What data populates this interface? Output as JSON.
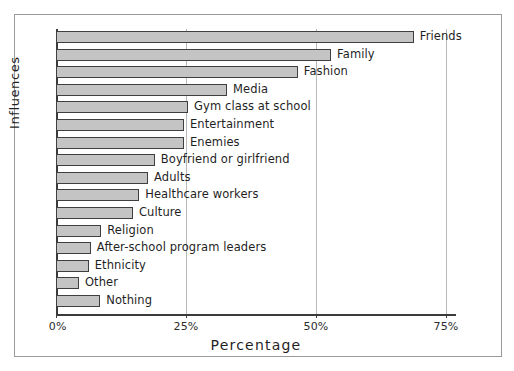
{
  "chart_data": {
    "type": "bar",
    "orientation": "horizontal",
    "title": "",
    "xlabel": "Percentage",
    "ylabel": "Influences",
    "xlim": [
      0,
      76.9
    ],
    "xticks": [
      0,
      25,
      50,
      75
    ],
    "xticklabels": [
      "0%",
      "25%",
      "50%",
      "75%"
    ],
    "grid": "vertical",
    "legend": "none",
    "categories": [
      "Friends",
      "Family",
      "Fashion",
      "Media",
      "Gym class at school",
      "Entertainment",
      "Enemies",
      "Boyfriend or girlfriend",
      "Adults",
      "Healthcare workers",
      "Culture",
      "Religion",
      "After-school program leaders",
      "Ethnicity",
      "Other",
      "Nothing"
    ],
    "values": [
      68.8,
      52.9,
      46.5,
      32.9,
      25.4,
      24.6,
      24.6,
      19.0,
      17.7,
      16.0,
      14.8,
      8.7,
      6.7,
      6.3,
      4.4,
      8.5
    ],
    "bar_fill_color": "#c4c4c4",
    "bar_edge_color": "#3f3f3f",
    "grid_color": "#b9b9b9",
    "axis_color": "#3b3b3b",
    "frame_color": "#9a9a9a",
    "background_color": "#ffffff"
  }
}
